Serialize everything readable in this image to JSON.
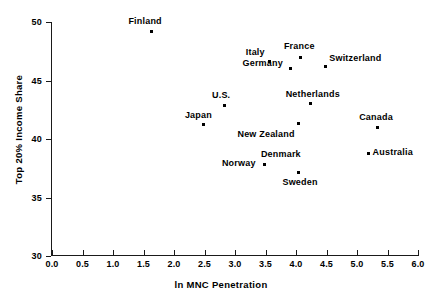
{
  "chart_data": {
    "type": "scatter",
    "title": "",
    "xlabel": "ln MNC Penetration",
    "ylabel": "Top 20% Income Share",
    "xlim": [
      0.0,
      6.0
    ],
    "ylim": [
      30,
      50
    ],
    "grid": false,
    "legend": "none",
    "xticks": [
      "0.0",
      "0.5",
      "1.0",
      "1.5",
      "2.0",
      "2.5",
      "3.0",
      "3.5",
      "4.0",
      "4.5",
      "5.0",
      "5.5",
      "6.0"
    ],
    "xtick_values": [
      0.0,
      0.5,
      1.0,
      1.5,
      2.0,
      2.5,
      3.0,
      3.5,
      4.0,
      4.5,
      5.0,
      5.5,
      6.0
    ],
    "yticks": [
      "30",
      "35",
      "40",
      "45",
      "50"
    ],
    "ytick_values": [
      30,
      35,
      40,
      45,
      50
    ],
    "marker_color": "#000000",
    "points": [
      {
        "label": "Finland",
        "x": 1.63,
        "y": 49.2,
        "label_dx": -23,
        "label_dy": -15
      },
      {
        "label": "Italy",
        "x": 3.57,
        "y": 46.6,
        "label_dx": -24,
        "label_dy": -15
      },
      {
        "label": "France",
        "x": 4.08,
        "y": 47.0,
        "label_dx": -17,
        "label_dy": -16
      },
      {
        "label": "Switzerland",
        "x": 4.48,
        "y": 46.2,
        "label_dx": 4,
        "label_dy": -13
      },
      {
        "label": "Germany",
        "x": 3.91,
        "y": 46.0,
        "label_dx": -48,
        "label_dy": -11
      },
      {
        "label": "U.S.",
        "x": 2.82,
        "y": 42.9,
        "label_dx": -12,
        "label_dy": -15
      },
      {
        "label": "Netherlands",
        "x": 4.24,
        "y": 43.0,
        "label_dx": -25,
        "label_dy": -15
      },
      {
        "label": "Japan",
        "x": 2.49,
        "y": 41.2,
        "label_dx": -19,
        "label_dy": -15
      },
      {
        "label": "New Zealand",
        "x": 4.04,
        "y": 41.3,
        "label_dx": -61,
        "label_dy": 5
      },
      {
        "label": "Canada",
        "x": 5.33,
        "y": 41.0,
        "label_dx": -18,
        "label_dy": -15
      },
      {
        "label": "Australia",
        "x": 5.19,
        "y": 38.8,
        "label_dx": 4,
        "label_dy": -6
      },
      {
        "label": "Norway",
        "x": 3.49,
        "y": 37.8,
        "label_dx": -43,
        "label_dy": -7
      },
      {
        "label": "Denmark",
        "x": 3.49,
        "y": 37.8,
        "label_dx": -4,
        "label_dy": -16
      },
      {
        "label": "Sweden",
        "x": 4.04,
        "y": 37.1,
        "label_dx": -16,
        "label_dy": 4
      }
    ]
  }
}
